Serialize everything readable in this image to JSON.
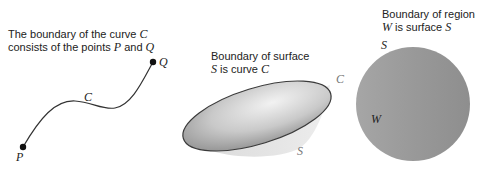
{
  "panels": [
    {
      "id": "curve",
      "caption_line1_text": "The boundary of the curve ",
      "caption_line1_math": "C",
      "caption_line2_text": "consists of the points ",
      "caption_line2_math1": "P",
      "caption_line2_mid": " and ",
      "caption_line2_math2": "Q",
      "labels": {
        "curve": "C",
        "start": "P",
        "end": "Q"
      }
    },
    {
      "id": "surface",
      "caption_line1_text": "Boundary of surface",
      "caption_line2_math1": "S",
      "caption_line2_text": " is curve ",
      "caption_line2_math2": "C",
      "labels": {
        "rim": "C",
        "surface": "S"
      }
    },
    {
      "id": "region",
      "caption_line1_text": "Boundary of region",
      "caption_line2_math1": "W",
      "caption_line2_text": " is surface ",
      "caption_line2_math2": "S",
      "labels": {
        "surface": "S",
        "region": "W"
      }
    }
  ],
  "colors": {
    "stroke": "#333333",
    "surface_light": "#e8e8e8",
    "surface_dark": "#8a8a8a",
    "sphere": "#9a9a9a"
  }
}
